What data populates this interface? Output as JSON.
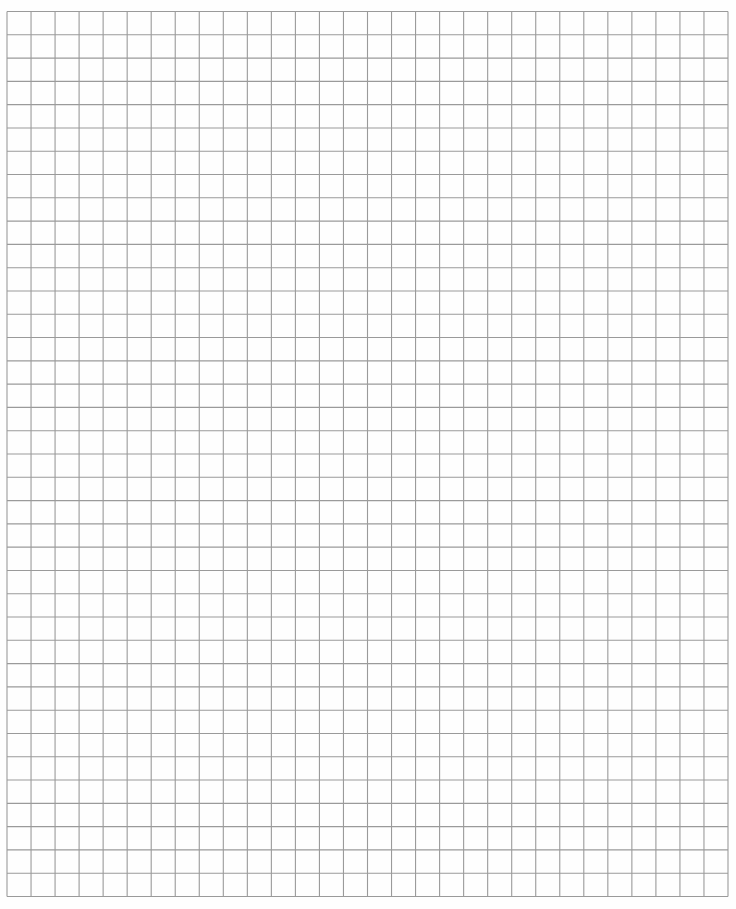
{
  "document": {
    "type": "graph-paper",
    "background_color": "#fefefe",
    "grid": {
      "columns": 30,
      "rows": 38,
      "left": 7,
      "top": 11.5,
      "width": 721,
      "height": 885,
      "line_color": "#9a9a9a",
      "line_width": 1.1,
      "major_lines": false
    }
  }
}
